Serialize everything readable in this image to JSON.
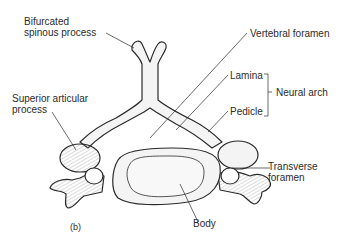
{
  "figure": {
    "panel_label": "(b)",
    "labels": {
      "bifurcated_spinous_process": [
        "Bifurcated",
        "spinous process"
      ],
      "vertebral_foramen": "Vertebral foramen",
      "lamina": "Lamina",
      "pedicle": "Pedicle",
      "neural_arch": "Neural arch",
      "superior_articular_process": [
        "Superior articular",
        "process"
      ],
      "transverse_foramen": [
        "Transverse",
        "foramen"
      ],
      "body": "Body"
    },
    "colors": {
      "line": "#2b2b2b",
      "bone_fill": "#f4f4f4",
      "shade": "#9a9a9a"
    }
  }
}
